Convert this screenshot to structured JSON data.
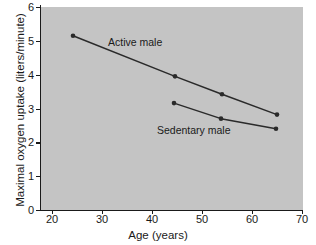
{
  "chart_data": {
    "type": "line",
    "title": "",
    "xlabel": "Age (years)",
    "ylabel": "Maximal oxygen uptake (liters/minute)",
    "xlim": [
      16,
      70
    ],
    "ylim": [
      0,
      6
    ],
    "xticks": [
      20,
      30,
      40,
      50,
      60,
      70
    ],
    "yticks": [
      0,
      1,
      2,
      3,
      4,
      5,
      6
    ],
    "xtick_labels": [
      "20",
      "30",
      "40",
      "50",
      "60",
      "70"
    ],
    "ytick_labels": [
      "0",
      "1",
      "2",
      "3",
      "4",
      "5",
      "6"
    ],
    "grid": false,
    "legend_position": "inline-annotation",
    "plot_background": "#c4c4c4",
    "figure_background": "#ffffff",
    "line_color": "#2a2a2a",
    "marker_color": "#2a2a2a",
    "series": [
      {
        "name": "Active male",
        "label": "Active male",
        "x": [
          24.2,
          44.6,
          54.0,
          65.0
        ],
        "values": [
          5.15,
          3.95,
          3.42,
          2.82
        ]
      },
      {
        "name": "Sedentary male",
        "label": "Sedentary male",
        "x": [
          44.4,
          53.8,
          64.8
        ],
        "values": [
          3.16,
          2.7,
          2.4
        ]
      }
    ],
    "annotations": [
      {
        "text": "Active male",
        "x": 34.5,
        "y": 4.6
      },
      {
        "text": "Sedentary male",
        "x": 48.0,
        "y": 2.2
      }
    ]
  }
}
